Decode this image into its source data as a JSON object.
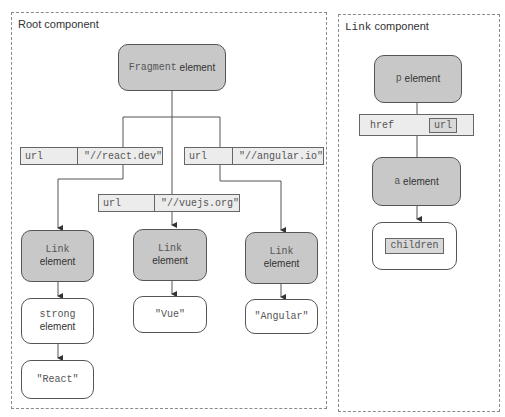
{
  "root_component": {
    "title": "Root component",
    "fragment": {
      "name": "Fragment",
      "suffix": " element"
    },
    "props": [
      {
        "key": "url",
        "value": "\"//react.dev\""
      },
      {
        "key": "url",
        "value": "\"//vuejs.org\""
      },
      {
        "key": "url",
        "value": "\"//angular.io\""
      }
    ],
    "links": [
      {
        "name": "Link",
        "suffix": "element"
      },
      {
        "name": "Link",
        "suffix": "element"
      },
      {
        "name": "Link",
        "suffix": "element"
      }
    ],
    "children": [
      {
        "name": "strong",
        "suffix": "element"
      },
      {
        "text": "\"Vue\""
      },
      {
        "text": "\"Angular\""
      }
    ],
    "grandchild": {
      "text": "\"React\""
    }
  },
  "link_component": {
    "title_mono": "Link",
    "title_rest": " component",
    "p_element": {
      "name": "p",
      "suffix": " element"
    },
    "prop": {
      "key": "href",
      "value": "url"
    },
    "a_element": {
      "name": "a",
      "suffix": " element"
    },
    "children": {
      "text": "children"
    }
  },
  "colors": {
    "dark_node": "#c8c8c8",
    "prop_bg": "#ececec",
    "border": "#555555"
  }
}
